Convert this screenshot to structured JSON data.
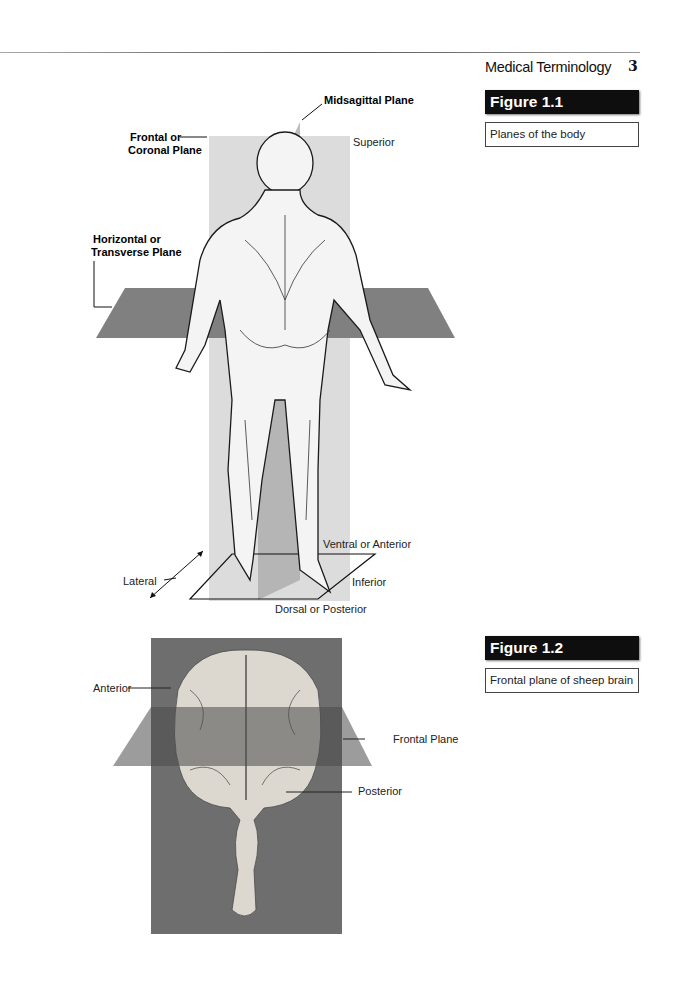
{
  "header": {
    "running_title": "Medical Terminology",
    "page_number": "3"
  },
  "figures": [
    {
      "label": "Figure 1.1",
      "caption": "Planes of the body",
      "annotations": {
        "midsagittal": "Midsagittal Plane",
        "frontal_line1": "Frontal or",
        "frontal_line2": "Coronal Plane",
        "horizontal_line1": "Horizontal or",
        "horizontal_line2": "Transverse Plane",
        "superior": "Superior",
        "ventral": "Ventral or Anterior",
        "lateral": "Lateral",
        "inferior": "Inferior",
        "dorsal": "Dorsal or Posterior"
      },
      "image_description": "Illustration of human figure viewed from behind with anatomical planes"
    },
    {
      "label": "Figure 1.2",
      "caption": "Frontal plane of sheep brain",
      "annotations": {
        "anterior": "Anterior",
        "frontal_plane": "Frontal Plane",
        "posterior": "Posterior"
      },
      "image_description": "Photograph of sheep brain on gray background with frontal plane overlay"
    }
  ],
  "colors": {
    "label_bg": "#0e0e0e",
    "plane_light": "#d6d6d6",
    "plane_dark": "#7a7a7a",
    "photo_bg": "#6e6e6e"
  }
}
